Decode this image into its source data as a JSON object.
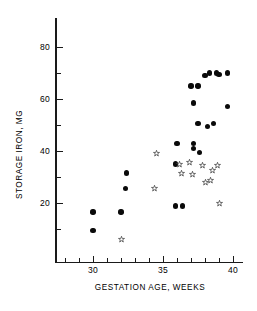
{
  "chart_data": {
    "type": "scatter",
    "title": "",
    "xlabel": "GESTATION AGE, WEEKS",
    "ylabel": "STORAGE IRON, MG",
    "xlim": [
      27.5,
      40.5
    ],
    "ylim": [
      0,
      84
    ],
    "x_ticks_major": [
      30,
      35,
      40
    ],
    "x_ticks_minor": [
      28,
      29,
      31,
      32,
      33,
      34,
      36,
      37,
      38,
      39
    ],
    "y_ticks_major": [
      20,
      40,
      60,
      80
    ],
    "y_ticks_minor": [
      10,
      30,
      50,
      70
    ],
    "grid": false,
    "legend": "none",
    "series": [
      {
        "name": "filled-circle",
        "marker": "filled-circle",
        "color": "#0a0a0a",
        "points": [
          {
            "x": 30.0,
            "y": 16.5
          },
          {
            "x": 30.0,
            "y": 9.5
          },
          {
            "x": 32.0,
            "y": 16.5
          },
          {
            "x": 32.3,
            "y": 25.5
          },
          {
            "x": 32.4,
            "y": 31.5
          },
          {
            "x": 35.9,
            "y": 18.8
          },
          {
            "x": 36.4,
            "y": 18.8
          },
          {
            "x": 35.9,
            "y": 35.0
          },
          {
            "x": 36.0,
            "y": 43.0
          },
          {
            "x": 37.2,
            "y": 43.0
          },
          {
            "x": 37.2,
            "y": 41.0
          },
          {
            "x": 37.6,
            "y": 39.5
          },
          {
            "x": 37.2,
            "y": 58.5
          },
          {
            "x": 37.0,
            "y": 65.0
          },
          {
            "x": 37.5,
            "y": 65.0
          },
          {
            "x": 37.5,
            "y": 50.5
          },
          {
            "x": 38.2,
            "y": 49.5
          },
          {
            "x": 38.6,
            "y": 50.5
          },
          {
            "x": 38.0,
            "y": 69.0
          },
          {
            "x": 38.3,
            "y": 70.0
          },
          {
            "x": 38.8,
            "y": 70.0
          },
          {
            "x": 39.0,
            "y": 69.5
          },
          {
            "x": 39.6,
            "y": 70.0
          },
          {
            "x": 39.6,
            "y": 57.0
          }
        ]
      },
      {
        "name": "open-star",
        "marker": "open-star",
        "color": "#4a4a4a",
        "points": [
          {
            "x": 32.0,
            "y": 6.0
          },
          {
            "x": 34.4,
            "y": 25.5
          },
          {
            "x": 34.5,
            "y": 39.0
          },
          {
            "x": 36.2,
            "y": 35.0
          },
          {
            "x": 36.3,
            "y": 31.5
          },
          {
            "x": 36.9,
            "y": 35.5
          },
          {
            "x": 37.1,
            "y": 31.0
          },
          {
            "x": 37.8,
            "y": 34.5
          },
          {
            "x": 38.0,
            "y": 28.0
          },
          {
            "x": 38.4,
            "y": 28.5
          },
          {
            "x": 38.5,
            "y": 32.5
          },
          {
            "x": 38.9,
            "y": 34.5
          },
          {
            "x": 39.0,
            "y": 20.0
          }
        ]
      }
    ]
  }
}
